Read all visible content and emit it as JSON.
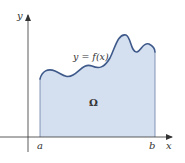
{
  "diagram": {
    "type": "area-under-curve",
    "region_label": "Ω",
    "curve_label": "y = f(x)",
    "axes": {
      "x_label": "x",
      "y_label": "y"
    },
    "bounds": {
      "left_label": "a",
      "right_label": "b"
    },
    "colors": {
      "fill": "#d4e0f0",
      "curve": "#3f5a8a",
      "axis": "#333333",
      "edge": "#5a7096"
    }
  }
}
